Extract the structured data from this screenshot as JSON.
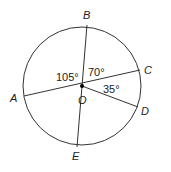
{
  "diagram": {
    "type": "circle-geometry",
    "center": {
      "label": "O",
      "x": 82,
      "y": 86
    },
    "radius": 59,
    "points": [
      {
        "label": "A",
        "x": 24,
        "y": 96,
        "lx": 10,
        "ly": 102
      },
      {
        "label": "B",
        "x": 87,
        "y": 25,
        "lx": 83,
        "ly": 19
      },
      {
        "label": "C",
        "x": 140,
        "y": 70,
        "lx": 145,
        "ly": 74
      },
      {
        "label": "D",
        "x": 138,
        "y": 107,
        "lx": 142,
        "ly": 115
      },
      {
        "label": "E",
        "x": 77,
        "y": 147,
        "lx": 72,
        "ly": 160
      }
    ],
    "segments": [
      "AC",
      "BE",
      "OD"
    ],
    "angles": [
      {
        "label": "105°",
        "x": 56,
        "y": 81
      },
      {
        "label": "70°",
        "x": 88,
        "y": 76
      },
      {
        "label": "35°",
        "x": 103,
        "y": 93
      }
    ],
    "center_label": {
      "label": "O",
      "x": 81,
      "y": 103
    }
  }
}
